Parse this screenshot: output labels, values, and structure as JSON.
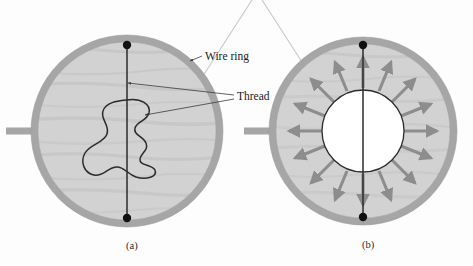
{
  "figure": {
    "panels": [
      {
        "id": "a",
        "caption": "(a)",
        "description": "Soap film fills entire wire ring; thread loop lies slack in an irregular shape",
        "center": [
          127,
          131
        ],
        "ring_outer_r": 96,
        "ring_thickness": 7,
        "film_state": "continuous",
        "thread_shape": "irregular-slack-loop",
        "has_handle": true,
        "dots": [
          [
            127,
            45
          ],
          [
            127,
            218
          ]
        ]
      },
      {
        "id": "b",
        "caption": "(b)",
        "description": "Film inside thread loop punctured; surface tension pulls thread into a circle",
        "center": [
          363,
          131
        ],
        "ring_outer_r": 94,
        "ring_thickness": 7,
        "film_state": "punctured-inside-loop",
        "thread_shape": "circle",
        "inner_circle_r": 41,
        "arrow_count": 16,
        "has_handle": true,
        "dots": [
          [
            363,
            45
          ],
          [
            363,
            217
          ]
        ]
      }
    ]
  },
  "labels": {
    "wire_ring": "Wire ring",
    "thread": "Thread"
  },
  "captions": {
    "a": "(a)",
    "b": "(b)"
  },
  "colors": {
    "background": "#fdfdfd",
    "ring_gray": "#a6a6a6",
    "ring_edge": "#8e8e8e",
    "film_gray": "#d2d2d2",
    "film_streak": "#c0c0c0",
    "arrow_gray": "#8d8d8d",
    "thread_line": "#2b2b2b",
    "dot_black": "#111111",
    "leader_line": "#3a3a3a",
    "crop_line": "#c8c8c8",
    "inner_circle_fill": "#ffffff",
    "text": "#1a1a1a"
  }
}
